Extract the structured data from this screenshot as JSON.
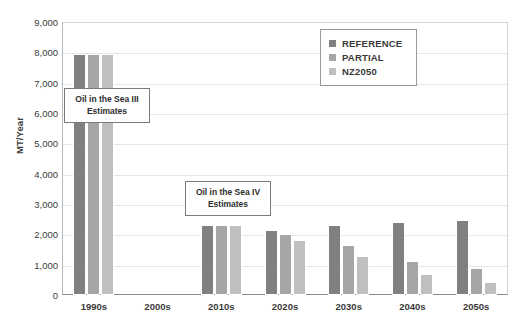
{
  "chart_data": {
    "type": "bar",
    "title": "",
    "xlabel": "",
    "ylabel": "MT/Year",
    "ylim": [
      0,
      9000
    ],
    "ytick_labels": [
      "9,000",
      "8,000",
      "7,000",
      "6,000",
      "5,000",
      "4,000",
      "3,000",
      "2,000",
      "1,000",
      "0"
    ],
    "ytick_values": [
      9000,
      8000,
      7000,
      6000,
      5000,
      4000,
      3000,
      2000,
      1000,
      0
    ],
    "grid": true,
    "legend_position": "top-right",
    "categories": [
      "1990s",
      "2000s",
      "2010s",
      "2020s",
      "2030s",
      "2040s",
      "2050s"
    ],
    "series": [
      {
        "name": "REFERENCE",
        "color": "#808080",
        "values": [
          7930,
          null,
          2300,
          2150,
          2300,
          2400,
          2480
        ]
      },
      {
        "name": "PARTIAL",
        "color": "#a6a6a6",
        "values": [
          7930,
          null,
          2300,
          2000,
          1650,
          1110,
          880
        ]
      },
      {
        "name": "NZ2050",
        "color": "#bfbfbf",
        "values": [
          7930,
          null,
          2300,
          1800,
          1300,
          700,
          430
        ]
      }
    ],
    "annotations": [
      {
        "id": "osiii",
        "text": "Oil in the Sea III Estimates"
      },
      {
        "id": "osiv",
        "text": "Oil in the Sea IV Estimates"
      }
    ]
  }
}
